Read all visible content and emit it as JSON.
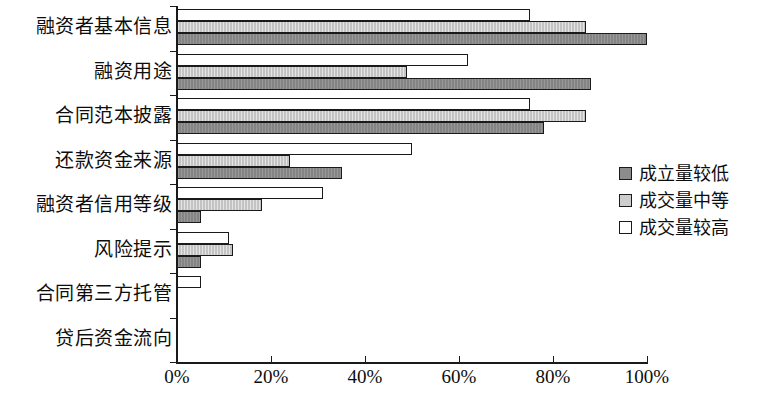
{
  "chart_data": {
    "type": "bar",
    "orientation": "horizontal",
    "title": "",
    "xlabel": "",
    "ylabel": "",
    "xlim": [
      0,
      100
    ],
    "xticks": [
      "0%",
      "20%",
      "40%",
      "60%",
      "80%",
      "100%"
    ],
    "xtick_values": [
      0,
      20,
      40,
      60,
      80,
      100
    ],
    "grid": false,
    "legend_position": "right",
    "categories": [
      "融资者基本信息",
      "融资用途",
      "合同范本披露",
      "还款资金来源",
      "融资者信用等级",
      "风险提示",
      "合同第三方托管",
      "贷后资金流向"
    ],
    "series": [
      {
        "name": "成立量较低",
        "color": "#8c8c8c",
        "values": [
          100,
          88,
          78,
          35,
          5,
          5,
          0,
          0
        ]
      },
      {
        "name": "成交量中等",
        "color": "#cdcdcd",
        "values": [
          87,
          49,
          87,
          24,
          18,
          12,
          0,
          0
        ]
      },
      {
        "name": "成交量较高",
        "color": "#ffffff",
        "values": [
          75,
          62,
          75,
          50,
          31,
          11,
          5,
          0
        ]
      }
    ]
  },
  "legend": {
    "items": [
      {
        "label": "成立量较低",
        "swatch": "dark-gray-swatch"
      },
      {
        "label": "成交量中等",
        "swatch": "light-gray-swatch"
      },
      {
        "label": "成交量较高",
        "swatch": "white-swatch"
      }
    ]
  },
  "axis": {
    "x_axis_name": "percentage-axis",
    "y_axis_name": "category-axis"
  }
}
